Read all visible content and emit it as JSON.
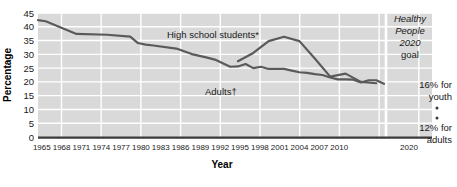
{
  "chart_data": {
    "type": "line",
    "title": "",
    "xlabel": "Year",
    "ylabel": "Percentage",
    "ylim": [
      0,
      45
    ],
    "ytick_values": [
      0,
      5,
      10,
      15,
      20,
      25,
      30,
      35,
      40,
      45
    ],
    "ytick_labels": [
      "0",
      "5",
      "10",
      "15",
      "20",
      "25",
      "30",
      "35",
      "40",
      "45"
    ],
    "xtick_labels": [
      "1965",
      "1968",
      "1971",
      "1974",
      "1977",
      "1980",
      "1983",
      "1986",
      "1989",
      "1992",
      "1995",
      "1998",
      "2001",
      "2004",
      "2007",
      "2010",
      "2020"
    ],
    "grid": true,
    "legend_position": "inline-annotations",
    "plot_bg": "#d9d9d9",
    "grid_color": "#ffffff",
    "line_color": "#5a5a5a",
    "series": [
      {
        "name": "Adults†",
        "label": "Adults†",
        "x": [
          1965,
          1966,
          1970,
          1974,
          1977,
          1978,
          1979,
          1980,
          1983,
          1985,
          1987,
          1988,
          1990,
          1991,
          1992,
          1993,
          1994,
          1995,
          1997,
          1998,
          1999,
          2000,
          2001,
          2002,
          2003,
          2004,
          2005,
          2006,
          2007,
          2008,
          2009,
          2010
        ],
        "values": [
          42.4,
          42.0,
          37.4,
          37.1,
          36.4,
          34.1,
          33.5,
          33.2,
          32.1,
          30.1,
          28.8,
          28.1,
          25.5,
          25.6,
          26.5,
          25.0,
          25.5,
          24.7,
          24.7,
          24.1,
          23.5,
          23.3,
          22.8,
          22.5,
          21.6,
          20.9,
          20.9,
          20.8,
          19.8,
          20.6,
          20.6,
          19.3
        ]
      },
      {
        "name": "High school students*",
        "label": "High school students*",
        "x": [
          1991,
          1993,
          1995,
          1997,
          1999,
          2001,
          2003,
          2005,
          2007,
          2009
        ],
        "values": [
          27.5,
          30.5,
          34.8,
          36.4,
          34.8,
          28.5,
          21.9,
          23.0,
          20.0,
          19.5
        ]
      }
    ],
    "annotations": [
      {
        "name": "healthy-people-goal-line-1",
        "text": "Healthy",
        "style": "italic"
      },
      {
        "name": "healthy-people-goal-line-2",
        "text": "People",
        "style": "italic"
      },
      {
        "name": "healthy-people-goal-line-3",
        "text": "2020",
        "style": "italic"
      },
      {
        "name": "healthy-people-goal-line-4",
        "text": "goal",
        "style": "normal"
      },
      {
        "name": "youth-goal-line-1",
        "text": "16% for"
      },
      {
        "name": "youth-goal-line-2",
        "text": "youth"
      },
      {
        "name": "adults-goal-line-1",
        "text": "12% for"
      },
      {
        "name": "adults-goal-line-2",
        "text": "adults"
      }
    ]
  },
  "axes": {
    "y_label": "Percentage",
    "x_label": "Year",
    "y_ticks": [
      "45",
      "40",
      "35",
      "30",
      "25",
      "20",
      "15",
      "10",
      "5",
      "0"
    ],
    "x_ticks": [
      "1965",
      "1968",
      "1971",
      "1974",
      "1977",
      "1980",
      "1983",
      "1986",
      "1989",
      "1992",
      "1995",
      "1998",
      "2001",
      "2004",
      "2007",
      "2010",
      "2020"
    ]
  },
  "series_labels": {
    "high_school": "High school students*",
    "adults": "Adults†"
  },
  "goal_panel": {
    "title_1": "Healthy",
    "title_2": "People",
    "title_3": "2020",
    "title_4": "goal",
    "youth_1": "16% for",
    "youth_2": "youth",
    "adults_1": "12% for",
    "adults_2": "adults"
  },
  "colors": {
    "plot_background": "#d9d9d9",
    "gridline": "#ffffff",
    "line": "#5a5a5a",
    "axis": "#333333",
    "text": "#1a1a1a"
  }
}
